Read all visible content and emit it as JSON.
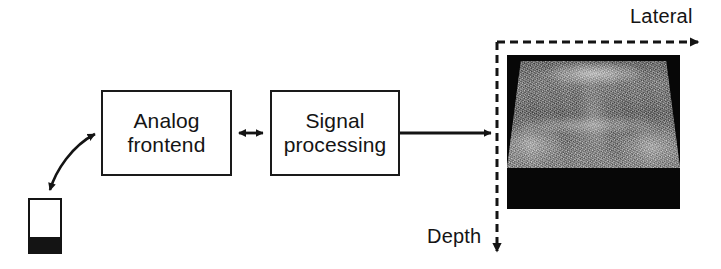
{
  "figure": {
    "type": "block-diagram",
    "caption_text": "Ultrasound imaging system block diagram"
  },
  "blocks": [
    {
      "id": "analog-frontend",
      "line1": "Analog",
      "line2": "frontend"
    },
    {
      "id": "signal-processing",
      "line1": "Signal",
      "line2": "processing"
    }
  ],
  "transducer": {
    "name": "transducer-probe",
    "face_color": "#141414",
    "body_color": "#ffffff"
  },
  "connections": [
    {
      "id": "probe-to-analog",
      "style": "curved",
      "heads": "double"
    },
    {
      "id": "analog-to-signal",
      "style": "straight",
      "heads": "double"
    },
    {
      "id": "signal-to-image",
      "style": "straight",
      "heads": "single"
    }
  ],
  "axes": {
    "lateral_label": "Lateral",
    "depth_label": "Depth",
    "line_style": "dashed",
    "color": "#141414"
  },
  "image_panel": {
    "name": "b-mode-ultrasound-image",
    "background": "#070707",
    "scan_shape": "trapezoid"
  },
  "colors": {
    "stroke": "#141414",
    "background": "#ffffff"
  }
}
